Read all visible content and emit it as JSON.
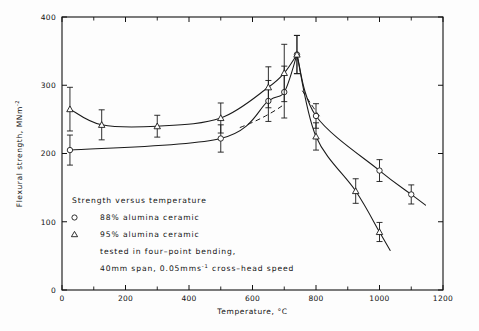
{
  "chart_data": {
    "type": "scatter",
    "title": "Strength versus temperature",
    "xlabel": "Temperature, °C",
    "ylabel": "Flexural strength, MNm⁻²",
    "ylabel_base": "Flexural strength, MNm",
    "ylabel_exp": "-2",
    "xlim": [
      0,
      1200
    ],
    "ylim": [
      0,
      400
    ],
    "xticks": [
      0,
      200,
      400,
      600,
      800,
      1000,
      1200
    ],
    "xticklabels": [
      "0",
      "200",
      "400",
      "600",
      "800",
      "1000",
      "1200"
    ],
    "xminorticks": [
      100,
      300,
      500,
      700,
      900,
      1100
    ],
    "yticks": [
      0,
      100,
      200,
      300,
      400
    ],
    "yticklabels": [
      "0",
      "100",
      "200",
      "300",
      "400"
    ],
    "grid": false,
    "legend_position": "lower-left-inside",
    "errorbars": true,
    "series": [
      {
        "name": "88% alumina ceramic",
        "marker": "circle",
        "label_pct": "88%",
        "points": [
          {
            "x": 25,
            "y": 205,
            "yerr": 22
          },
          {
            "x": 500,
            "y": 222,
            "yerr": 20
          },
          {
            "x": 650,
            "y": 277,
            "yerr": 30
          },
          {
            "x": 700,
            "y": 290,
            "yerr": 38
          },
          {
            "x": 740,
            "y": 345,
            "yerr": 28
          },
          {
            "x": 800,
            "y": 255,
            "yerr": 18
          },
          {
            "x": 1000,
            "y": 175,
            "yerr": 16
          },
          {
            "x": 1100,
            "y": 140,
            "yerr": 14
          }
        ]
      },
      {
        "name": "95% alumina ceramic",
        "marker": "triangle",
        "label_pct": "95%",
        "points": [
          {
            "x": 25,
            "y": 265,
            "yerr": 32
          },
          {
            "x": 125,
            "y": 242,
            "yerr": 22
          },
          {
            "x": 300,
            "y": 240,
            "yerr": 16
          },
          {
            "x": 500,
            "y": 252,
            "yerr": 22
          },
          {
            "x": 650,
            "y": 297,
            "yerr": 30
          },
          {
            "x": 700,
            "y": 318,
            "yerr": 42
          },
          {
            "x": 740,
            "y": 345,
            "yerr": 28
          },
          {
            "x": 800,
            "y": 225,
            "yerr": 20
          },
          {
            "x": 925,
            "y": 145,
            "yerr": 18
          },
          {
            "x": 1000,
            "y": 85,
            "yerr": 14
          }
        ]
      }
    ],
    "annotations": {
      "dashed_branch": "extrapolated 88% trend merging into peak"
    }
  },
  "legend": {
    "title": "Strength  versus  temperature",
    "entries": [
      {
        "marker": "circle",
        "text": "88%  alumina  ceramic"
      },
      {
        "marker": "triangle",
        "text": "95%  alumina  ceramic"
      }
    ],
    "note_line1": "tested  in  four–point  bending,",
    "note_line2_a": "40mm  span,   0.05mms",
    "note_line2_exp": "-1",
    "note_line2_b": " cross–head  speed"
  },
  "style": {
    "line_color": "#1a1a1a",
    "axis_color": "#111111",
    "background": "#fdfdfd"
  }
}
